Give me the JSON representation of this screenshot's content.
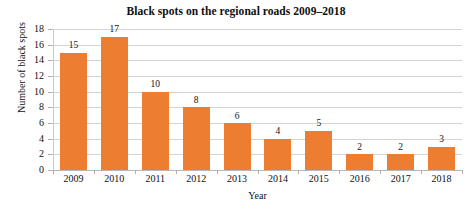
{
  "chart_data": {
    "type": "bar",
    "title": "Black spots on the regional roads 2009–2018",
    "xlabel": "Year",
    "ylabel": "Number of black spots",
    "categories": [
      "2009",
      "2010",
      "2011",
      "2012",
      "2013",
      "2014",
      "2015",
      "2016",
      "2017",
      "2018"
    ],
    "values": [
      15,
      17,
      10,
      8,
      6,
      4,
      5,
      2,
      2,
      3
    ],
    "data_labels": [
      "15",
      "17",
      "10",
      "8",
      "6",
      "4",
      "5",
      "2",
      "2",
      "3"
    ],
    "ylim": [
      0,
      18
    ],
    "ytick_step": 2,
    "yticks": [
      "0",
      "2",
      "4",
      "6",
      "8",
      "10",
      "12",
      "14",
      "16",
      "18"
    ],
    "grid": true,
    "grid_axis": "y",
    "legend": false,
    "legend_position": "none",
    "series": [
      {
        "name": "Number of black spots",
        "color": "#ED7D31",
        "values": [
          15,
          17,
          10,
          8,
          6,
          4,
          5,
          2,
          2,
          3
        ]
      }
    ]
  },
  "colors": {
    "bar": "#ED7D31",
    "gridline": "#d4d4d4",
    "axis": "#b8b8b8",
    "text": "#111111",
    "background": "#ffffff"
  }
}
